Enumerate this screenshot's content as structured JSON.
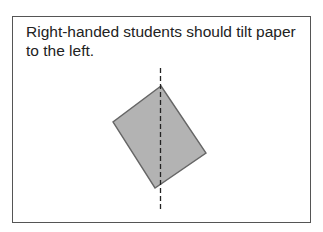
{
  "caption": {
    "line1": "Right-handed students should tilt paper",
    "line2": "to the left."
  },
  "figure": {
    "paper_fill": "#b3b3b3",
    "paper_stroke": "#666666",
    "paper_corners": {
      "top": [
        161,
        86
      ],
      "left": [
        113,
        122
      ],
      "bottom": [
        155,
        188
      ],
      "right": [
        206,
        153
      ]
    },
    "axis_line": {
      "x": 160.5,
      "y_start": 68,
      "y_end": 209,
      "style": "dashed",
      "color": "#222222"
    }
  }
}
